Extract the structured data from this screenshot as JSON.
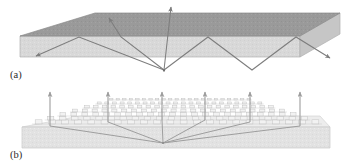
{
  "figure": {
    "background_color": "#ffffff"
  },
  "colors": {
    "slab_top_face": "#9a9a9a",
    "slab_top_face_dark": "#8f8f8f",
    "slab_front_face": "#d8d8d8",
    "slab_side_face": "#c4c4c4",
    "substrate_face": "#e2e2e2",
    "substrate_top": "#ededed",
    "pillar_fill": "#f2f2f2",
    "pillar_stroke": "#bfbfbf",
    "ray_stroke": "#7d7d7d",
    "arrow_stroke": "#8a8a8a",
    "label_text": "#2b2b2b",
    "outline": "#9e9e9e"
  },
  "panels": [
    {
      "id": "panel-a",
      "label": "(a)",
      "label_x": 10,
      "label_y": 78,
      "description": "Unpatterned slab: most emitted rays are trapped by total internal reflection and zig-zag inside the guide; only a small escape cone emerges.",
      "slab": {
        "type": "parallelepiped",
        "top_face": "20,36 95,13 340,13 300,36",
        "front_face": "20,36 300,36 300,57 20,57",
        "right_face": "300,36 340,13 340,34 300,57",
        "top_edge_y": 36,
        "bottom_edge_y": 57
      },
      "source": {
        "x": 164,
        "y": 70,
        "label": "emission point"
      },
      "rays": [
        {
          "name": "escape-ray-left",
          "path": "164,70 110,16",
          "arrow": true,
          "desc": "ray escaping through top face toward upper-left"
        },
        {
          "name": "escape-ray-center",
          "path": "164,70 171,6",
          "arrow": true,
          "desc": "near-vertical ray escaping through top face"
        },
        {
          "name": "guided-ray-left",
          "path": "164,70 79,37 36,56",
          "arrow": true,
          "desc": "totally internally reflected, exits left edge"
        },
        {
          "name": "guided-ray-right",
          "path": "164,70 208,37 252,70 296,37 330,58",
          "arrow": true,
          "desc": "zig-zag guided mode, exits right edge"
        },
        {
          "name": "guided-ray-left-steep",
          "path": "164,70 121,37 108,18",
          "arrow": false,
          "desc": "steep internal ray at escape-cone boundary"
        }
      ],
      "arrow_count": 5
    },
    {
      "id": "panel-b",
      "label": "(b)",
      "label_x": 10,
      "label_y": 158,
      "description": "Photonic-crystal patterned surface: guided modes are Bragg-diffracted and extracted vertically, shown by six upward arrows.",
      "substrate": {
        "type": "slab",
        "front_face": "22,127 330,127 330,148 22,148",
        "top_face": "22,127 80,116 320,116 330,127"
      },
      "crystal_layer": {
        "name": "photonic-crystal lattice",
        "rows": 7,
        "cols": 22,
        "near_y": 124,
        "far_y": 100,
        "near_left_x": 32,
        "near_right_x": 322,
        "far_left_x": 108,
        "far_right_x": 252
      },
      "source": {
        "x": 163,
        "y": 143,
        "label": "emission point"
      },
      "extraction_arrows": [
        {
          "name": "extraction-arrow-1",
          "x": 50,
          "top_y": 92,
          "base_y": 126
        },
        {
          "name": "extraction-arrow-2",
          "x": 108,
          "top_y": 92,
          "base_y": 122
        },
        {
          "name": "extraction-arrow-3",
          "x": 162,
          "top_y": 92,
          "base_y": 120
        },
        {
          "name": "extraction-arrow-4",
          "x": 205,
          "top_y": 92,
          "base_y": 120
        },
        {
          "name": "extraction-arrow-5",
          "x": 250,
          "top_y": 92,
          "base_y": 122
        },
        {
          "name": "extraction-arrow-6",
          "x": 300,
          "top_y": 92,
          "base_y": 126
        }
      ],
      "guided_rays": [
        {
          "name": "guided-ray-b-1",
          "path": "163,143 50,126"
        },
        {
          "name": "guided-ray-b-2",
          "path": "163,143 108,122"
        },
        {
          "name": "guided-ray-b-3",
          "path": "163,143 162,120"
        },
        {
          "name": "guided-ray-b-4",
          "path": "163,143 205,120"
        },
        {
          "name": "guided-ray-b-5",
          "path": "163,143 250,122"
        },
        {
          "name": "guided-ray-b-6",
          "path": "163,143 300,126"
        }
      ],
      "arrow_count": 6
    }
  ]
}
